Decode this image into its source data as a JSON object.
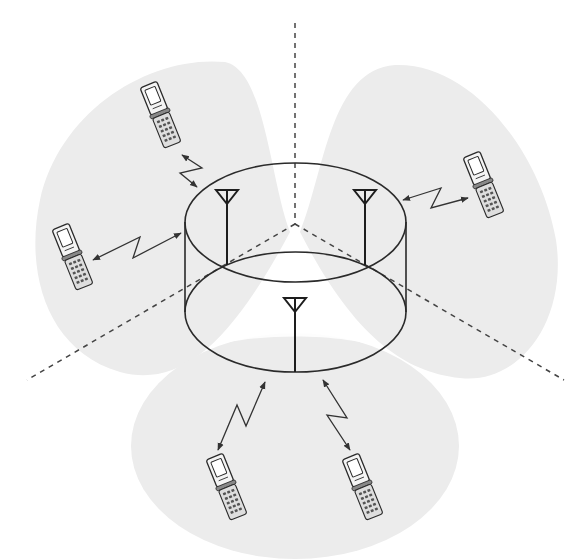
{
  "diagram": {
    "title": "Three-sector base station with directional antennas serving mobile phones",
    "colors": {
      "background": "#ffffff",
      "coverage_lobe": "#ececec",
      "line": "#2a2a2a",
      "dashed_divider": "#444444"
    },
    "base_station": {
      "shape": "cylinder",
      "antennas": [
        {
          "id": "antenna-left",
          "icon": "antenna-icon",
          "x": 227
        },
        {
          "id": "antenna-right",
          "icon": "antenna-icon",
          "x": 365
        },
        {
          "id": "antenna-front",
          "icon": "antenna-icon",
          "x": 295
        }
      ]
    },
    "sectors": [
      {
        "id": "sector-left",
        "phones": 2
      },
      {
        "id": "sector-right",
        "phones": 1
      },
      {
        "id": "sector-bottom",
        "phones": 2
      }
    ],
    "sector_dividers": 3,
    "mobile_phones": [
      {
        "id": "phone-top-left",
        "icon": "flip-phone-icon",
        "sector": "left"
      },
      {
        "id": "phone-left",
        "icon": "flip-phone-icon",
        "sector": "left"
      },
      {
        "id": "phone-right",
        "icon": "flip-phone-icon",
        "sector": "right"
      },
      {
        "id": "phone-bottom-left",
        "icon": "flip-phone-icon",
        "sector": "bottom"
      },
      {
        "id": "phone-bottom-right",
        "icon": "flip-phone-icon",
        "sector": "bottom"
      }
    ],
    "radio_links": [
      {
        "id": "link-top-left",
        "icon": "radio-link-icon",
        "bidirectional": true
      },
      {
        "id": "link-left",
        "icon": "radio-link-icon",
        "bidirectional": true
      },
      {
        "id": "link-right",
        "icon": "radio-link-icon",
        "bidirectional": true
      },
      {
        "id": "link-bottom-left",
        "icon": "radio-link-icon",
        "bidirectional": true
      },
      {
        "id": "link-bottom-right",
        "icon": "radio-link-icon",
        "bidirectional": true
      }
    ]
  }
}
